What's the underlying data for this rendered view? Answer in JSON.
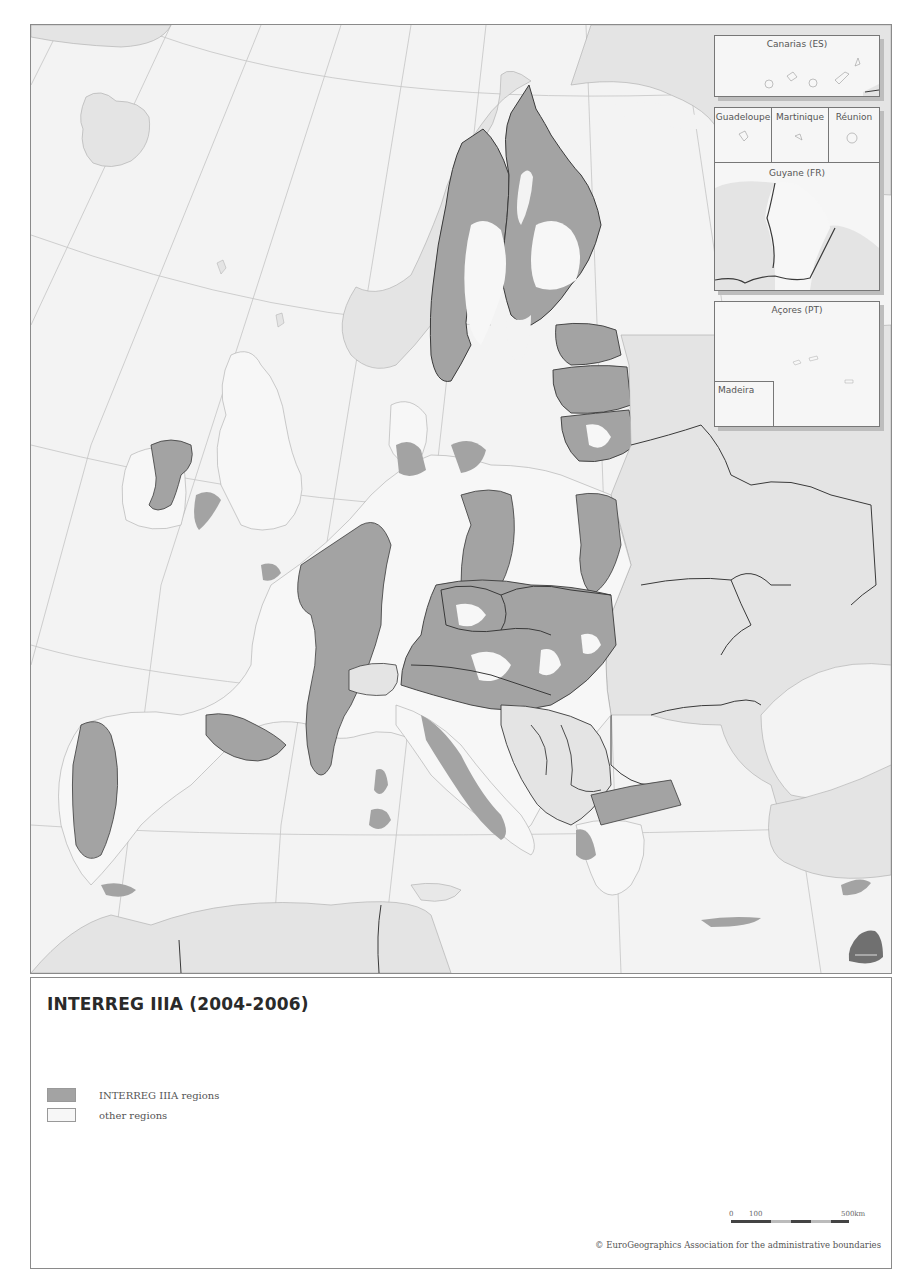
{
  "map": {
    "title": "INTERREG IIIA (2004-2006)",
    "colors": {
      "sea": "#f3f3f3",
      "non_eu_land": "#e4e4e4",
      "other_regions": "#f7f7f7",
      "interreg_regions": "#a3a3a3",
      "national_border": "#3a3a3a",
      "graticule": "#c4c4c4"
    },
    "insets": {
      "canarias": "Canarias (ES)",
      "guadeloupe": "Guadeloupe",
      "martinique": "Martinique",
      "reunion": "Réunion",
      "guyane": "Guyane (FR)",
      "acores": "Açores (PT)",
      "madeira": "Madeira"
    },
    "logo_icon": "regiogis-logo-icon"
  },
  "legend": {
    "items": [
      {
        "label": "INTERREG IIIA regions",
        "color": "#a3a3a3"
      },
      {
        "label": "other regions",
        "color": "#f7f7f7"
      }
    ]
  },
  "scale": {
    "ticks": [
      "0",
      "100",
      "500km"
    ]
  },
  "footer": {
    "copyright": "© EuroGeographics Association for the administrative boundaries"
  }
}
